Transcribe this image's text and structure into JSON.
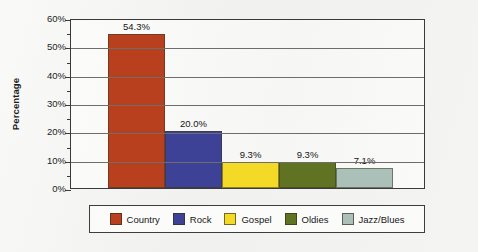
{
  "chart_data": {
    "type": "bar",
    "title": "",
    "xlabel": "",
    "ylabel": "Percentage",
    "categories": [
      "Country",
      "Rock",
      "Gospel",
      "Oldies",
      "Jazz/Blues"
    ],
    "values": [
      54.3,
      20.0,
      9.3,
      9.3,
      7.1
    ],
    "data_labels": [
      "54.3%",
      "20.0%",
      "9.3%",
      "9.3%",
      "7.1%"
    ],
    "ylim": [
      0,
      60
    ],
    "ytick_values": [
      0,
      10,
      20,
      30,
      40,
      50,
      60
    ],
    "ytick_labels": [
      "0%",
      "10%",
      "20%",
      "30%",
      "40%",
      "50%",
      "60%"
    ],
    "minor_tick_values": [
      5,
      15,
      25,
      35,
      45,
      55
    ],
    "grid": true,
    "grid_axis": "y",
    "legend_position": "bottom",
    "colors": [
      "#b8401f",
      "#3e4296",
      "#f5d927",
      "#5f7323",
      "#acc0ba"
    ],
    "series": [
      {
        "name": "Percentage",
        "values": [
          54.3,
          20.0,
          9.3,
          9.3,
          7.1
        ]
      }
    ]
  },
  "axis": {
    "y_title": "Percentage",
    "ticks": [
      {
        "label": "60%"
      },
      {
        "label": "50%"
      },
      {
        "label": "40%"
      },
      {
        "label": "30%"
      },
      {
        "label": "20%"
      },
      {
        "label": "10%"
      },
      {
        "label": "0%"
      }
    ]
  },
  "legend": {
    "items": [
      {
        "label": "Country",
        "color": "#b8401f"
      },
      {
        "label": "Rock",
        "color": "#3e4296"
      },
      {
        "label": "Gospel",
        "color": "#f5d927"
      },
      {
        "label": "Oldies",
        "color": "#5f7323"
      },
      {
        "label": "Jazz/Blues",
        "color": "#acc0ba"
      }
    ]
  }
}
